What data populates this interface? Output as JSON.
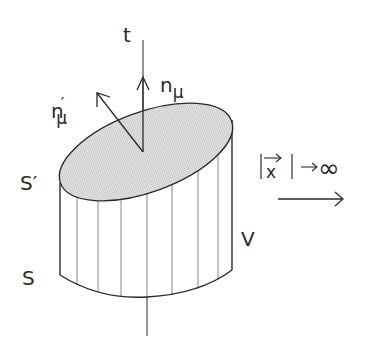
{
  "diagram": {
    "labels": {
      "time_axis": "t",
      "normal": "n",
      "normal_sub": "μ",
      "normal_prime": "n",
      "normal_prime_mark": "′",
      "normal_prime_sub": "μ",
      "top_surface": "S′",
      "bottom_surface": "S",
      "volume": "V",
      "limit_bar_left": "|",
      "limit_vector": "x",
      "limit_vector_arrow": "→",
      "limit_bar_right": "|",
      "limit_arrow": "→",
      "limit_value": "∞"
    },
    "colors": {
      "line": "#2a2a2a",
      "surface_fill": "#d4d4d4",
      "background": "#ffffff"
    }
  }
}
